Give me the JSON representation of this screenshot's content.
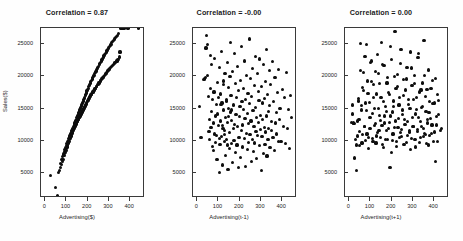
{
  "figure": {
    "width": 463,
    "height": 241,
    "background": "#fefefe",
    "point_color": "#0d0d0d",
    "axis_color": "#3a3a3a",
    "text_color": "#1f1f1f"
  },
  "chart_data": [
    {
      "type": "scatter",
      "title": "Correlation = 0.87",
      "xlabel": "Advertising($)",
      "ylabel": "Sales($)",
      "xlim": [
        -20,
        470
      ],
      "ylim": [
        1200,
        27500
      ],
      "xticks": [
        0,
        100,
        200,
        300,
        400
      ],
      "yticks": [
        5000,
        10000,
        15000,
        20000,
        25000
      ],
      "grid": false,
      "legend": null,
      "n_points": 200,
      "correlation": 0.87,
      "x": [
        24,
        49,
        58,
        62,
        66,
        70,
        73,
        76,
        78,
        80,
        82,
        84,
        86,
        88,
        90,
        91,
        93,
        95,
        96,
        98,
        99,
        101,
        102,
        104,
        105,
        106,
        108,
        109,
        110,
        112,
        113,
        114,
        116,
        117,
        118,
        119,
        121,
        122,
        123,
        125,
        126,
        127,
        128,
        130,
        131,
        132,
        133,
        134,
        136,
        137,
        138,
        139,
        140,
        141,
        143,
        144,
        145,
        146,
        147,
        148,
        150,
        151,
        152,
        153,
        154,
        155,
        157,
        158,
        159,
        160,
        161,
        162,
        163,
        165,
        166,
        167,
        168,
        169,
        170,
        171,
        172,
        174,
        175,
        176,
        177,
        178,
        179,
        180,
        181,
        183,
        184,
        185,
        186,
        187,
        188,
        189,
        190,
        192,
        193,
        194,
        195,
        196,
        197,
        198,
        200,
        201,
        202,
        203,
        205,
        206,
        207,
        208,
        210,
        211,
        212,
        214,
        215,
        216,
        218,
        219,
        221,
        222,
        224,
        225,
        227,
        228,
        230,
        231,
        233,
        234,
        236,
        237,
        239,
        240,
        242,
        243,
        245,
        246,
        248,
        250,
        251,
        253,
        254,
        256,
        257,
        259,
        261,
        262,
        264,
        265,
        267,
        269,
        270,
        272,
        274,
        275,
        277,
        279,
        280,
        282,
        284,
        286,
        287,
        289,
        291,
        293,
        295,
        296,
        298,
        300,
        302,
        304,
        306,
        308,
        310,
        312,
        314,
        316,
        318,
        320,
        322,
        325,
        327,
        329,
        331,
        334,
        336,
        338,
        341,
        343,
        346,
        349,
        352,
        355,
        359,
        363,
        368,
        375,
        390,
        440
      ],
      "y": [
        4700,
        2800,
        1500,
        5100,
        5500,
        6600,
        5900,
        6400,
        7100,
        6900,
        7600,
        7200,
        8000,
        7800,
        8400,
        8100,
        8700,
        8300,
        9000,
        8600,
        9300,
        8900,
        9600,
        9100,
        9900,
        9400,
        10100,
        9700,
        10400,
        9900,
        10600,
        10200,
        10800,
        10400,
        11000,
        10600,
        11200,
        10800,
        11400,
        11000,
        11600,
        11200,
        11800,
        11400,
        12000,
        11600,
        12200,
        11800,
        12400,
        12000,
        12600,
        12100,
        12800,
        12300,
        13000,
        12500,
        13200,
        12600,
        13400,
        12800,
        13600,
        13000,
        13800,
        13100,
        14000,
        13300,
        14200,
        13400,
        14400,
        13600,
        14600,
        13700,
        14800,
        13900,
        15000,
        14000,
        15200,
        14200,
        15400,
        14300,
        15600,
        14500,
        15800,
        14600,
        16000,
        14800,
        16200,
        14900,
        16400,
        15100,
        16600,
        15200,
        16800,
        15400,
        17000,
        15500,
        17200,
        15700,
        17400,
        15800,
        17600,
        16000,
        17800,
        16100,
        18000,
        16300,
        18200,
        16400,
        18400,
        16600,
        18600,
        16700,
        18800,
        16900,
        19000,
        17000,
        19200,
        17200,
        19400,
        17300,
        19600,
        17500,
        19800,
        17600,
        20000,
        17800,
        20200,
        17900,
        20400,
        18100,
        20600,
        18200,
        20800,
        18400,
        21000,
        18500,
        21200,
        18700,
        21400,
        18800,
        21600,
        19000,
        21800,
        19100,
        22000,
        19300,
        22200,
        19400,
        22400,
        19600,
        22600,
        19700,
        22800,
        19900,
        23000,
        20000,
        23200,
        20200,
        23400,
        20300,
        23600,
        20500,
        23800,
        20600,
        24000,
        20800,
        24200,
        20900,
        24400,
        21100,
        24600,
        21200,
        24800,
        21400,
        25000,
        21500,
        25200,
        21700,
        25400,
        21800,
        25600,
        22000,
        25800,
        22100,
        26000,
        22300,
        26200,
        22400,
        26400,
        22600,
        26600,
        23000,
        23800
      ]
    },
    {
      "type": "scatter",
      "title": "Correlation = -0.00",
      "xlabel": "Advertising(t-1)",
      "ylabel": "",
      "xlim": [
        -20,
        470
      ],
      "ylim": [
        1200,
        27500
      ],
      "xticks": [
        0,
        100,
        200,
        300,
        400
      ],
      "yticks": [
        5000,
        10000,
        15000,
        20000,
        25000
      ],
      "grid": false,
      "legend": null,
      "n_points": 200,
      "correlation": -0.0,
      "x": [
        12,
        18,
        28,
        33,
        37,
        41,
        44,
        47,
        50,
        52,
        55,
        57,
        59,
        61,
        63,
        65,
        67,
        69,
        71,
        73,
        75,
        77,
        79,
        81,
        83,
        85,
        87,
        89,
        91,
        93,
        95,
        97,
        99,
        101,
        103,
        105,
        107,
        109,
        111,
        113,
        115,
        117,
        119,
        121,
        123,
        125,
        127,
        129,
        131,
        133,
        135,
        137,
        139,
        141,
        143,
        145,
        147,
        149,
        151,
        153,
        155,
        157,
        159,
        161,
        163,
        165,
        167,
        169,
        171,
        173,
        175,
        177,
        179,
        181,
        183,
        185,
        187,
        189,
        191,
        193,
        195,
        197,
        199,
        201,
        203,
        205,
        207,
        209,
        211,
        213,
        215,
        217,
        219,
        221,
        223,
        225,
        227,
        229,
        231,
        233,
        235,
        237,
        239,
        241,
        243,
        245,
        247,
        249,
        251,
        253,
        255,
        257,
        259,
        261,
        263,
        265,
        267,
        269,
        271,
        273,
        275,
        277,
        279,
        281,
        283,
        285,
        287,
        289,
        291,
        293,
        295,
        297,
        299,
        301,
        303,
        305,
        307,
        309,
        311,
        313,
        315,
        317,
        319,
        321,
        323,
        325,
        327,
        329,
        331,
        333,
        335,
        337,
        339,
        341,
        343,
        345,
        348,
        351,
        354,
        357,
        360,
        363,
        366,
        369,
        372,
        375,
        378,
        381,
        384,
        387,
        390,
        395,
        400,
        405,
        410,
        415,
        420,
        425,
        430,
        435,
        440,
        445,
        106,
        112,
        118,
        124,
        130,
        136,
        142,
        148,
        154,
        160
      ],
      "y": [
        15300,
        10500,
        19500,
        19600,
        19800,
        24400,
        26300,
        20200,
        24900,
        16900,
        11500,
        13400,
        10300,
        23300,
        18200,
        12100,
        14600,
        21900,
        9200,
        16400,
        8500,
        12800,
        17600,
        11100,
        22800,
        9800,
        13900,
        15700,
        10900,
        7200,
        19100,
        14200,
        16800,
        12400,
        5100,
        21400,
        9500,
        13100,
        17300,
        10700,
        23900,
        15900,
        6300,
        12000,
        14800,
        18700,
        9900,
        11600,
        20500,
        13600,
        7800,
        16200,
        10200,
        22100,
        12900,
        5600,
        15100,
        18300,
        8900,
        11300,
        14500,
        25200,
        17100,
        9600,
        13200,
        6700,
        20800,
        11900,
        15600,
        10100,
        23600,
        12600,
        18900,
        8200,
        14100,
        16700,
        9400,
        21600,
        12200,
        5900,
        17800,
        10600,
        13800,
        15400,
        7500,
        19400,
        11700,
        24700,
        16100,
        9100,
        12500,
        14900,
        18100,
        10400,
        22400,
        13500,
        6100,
        16500,
        11200,
        20100,
        14300,
        8700,
        17400,
        9800,
        12700,
        15800,
        25800,
        11000,
        19700,
        13100,
        6900,
        16900,
        10300,
        21200,
        14700,
        8400,
        12300,
        18600,
        9700,
        23100,
        15200,
        11500,
        13700,
        7300,
        20400,
        10900,
        17700,
        12900,
        16300,
        9300,
        22700,
        14000,
        11800,
        5400,
        18400,
        10700,
        13400,
        15900,
        8100,
        21800,
        12100,
        16600,
        9500,
        19200,
        11400,
        24200,
        13900,
        7700,
        17200,
        10200,
        14600,
        12000,
        20900,
        15500,
        9000,
        18800,
        11600,
        13000,
        22300,
        10500,
        16100,
        8600,
        19900,
        12800,
        14400,
        11100,
        17500,
        9900,
        21100,
        13300,
        15000,
        10000,
        18000,
        12200,
        16800,
        9600,
        20600,
        11900,
        14900,
        8800,
        17000,
        13600,
        10400,
        15700,
        12400,
        19300,
        11000,
        16400,
        9400,
        13800,
        20000,
        14800
      ]
    },
    {
      "type": "scatter",
      "title": "Correlation = 0.00",
      "xlabel": "Advertising(t+1)",
      "ylabel": "",
      "xlim": [
        -20,
        470
      ],
      "ylim": [
        1200,
        27500
      ],
      "xticks": [
        0,
        100,
        200,
        300,
        400
      ],
      "yticks": [
        5000,
        10000,
        15000,
        20000,
        25000
      ],
      "grid": false,
      "legend": null,
      "n_points": 200,
      "correlation": 0.0,
      "x": [
        10,
        16,
        22,
        30,
        36,
        40,
        44,
        48,
        52,
        56,
        60,
        64,
        68,
        72,
        76,
        80,
        84,
        88,
        92,
        96,
        100,
        104,
        108,
        112,
        116,
        120,
        124,
        128,
        132,
        136,
        140,
        144,
        148,
        152,
        156,
        160,
        164,
        168,
        172,
        176,
        180,
        184,
        188,
        192,
        196,
        200,
        204,
        208,
        212,
        216,
        220,
        224,
        228,
        232,
        236,
        240,
        244,
        248,
        252,
        256,
        260,
        264,
        268,
        272,
        276,
        280,
        284,
        288,
        292,
        296,
        300,
        304,
        308,
        312,
        316,
        320,
        324,
        328,
        332,
        336,
        340,
        344,
        348,
        352,
        356,
        360,
        364,
        368,
        372,
        376,
        380,
        385,
        390,
        395,
        400,
        405,
        410,
        415,
        420,
        430,
        14,
        20,
        26,
        34,
        38,
        42,
        46,
        50,
        54,
        58,
        62,
        66,
        70,
        74,
        78,
        82,
        86,
        90,
        94,
        98,
        102,
        106,
        110,
        114,
        118,
        122,
        126,
        130,
        134,
        138,
        142,
        146,
        150,
        154,
        158,
        162,
        166,
        170,
        174,
        178,
        182,
        186,
        190,
        194,
        198,
        202,
        206,
        210,
        214,
        218,
        222,
        226,
        230,
        234,
        238,
        242,
        246,
        250,
        254,
        258,
        262,
        266,
        270,
        274,
        278,
        282,
        286,
        290,
        294,
        298,
        302,
        306,
        310,
        314,
        318,
        322,
        326,
        330,
        334,
        338,
        342,
        346,
        350,
        354,
        358,
        362,
        366,
        370,
        374,
        378,
        382,
        387,
        392,
        397,
        402,
        407,
        412,
        417,
        422,
        435
      ],
      "y": [
        12900,
        15600,
        12700,
        10200,
        9400,
        13100,
        16200,
        11500,
        25100,
        14800,
        9700,
        18300,
        20600,
        12200,
        15900,
        24900,
        11100,
        17400,
        10500,
        13600,
        22100,
        19200,
        14300,
        9900,
        16700,
        12400,
        20800,
        10800,
        23400,
        15100,
        11700,
        18900,
        13200,
        25300,
        9500,
        16100,
        21700,
        12800,
        10300,
        14600,
        19800,
        11900,
        17200,
        5900,
        13900,
        22600,
        10100,
        15400,
        12100,
        26900,
        18100,
        9200,
        20300,
        13500,
        16800,
        11300,
        24200,
        10700,
        14100,
        19500,
        12600,
        17900,
        9800,
        21400,
        13000,
        15700,
        11600,
        23800,
        10400,
        18600,
        12300,
        16400,
        20100,
        9100,
        14900,
        11800,
        22900,
        13700,
        17600,
        10600,
        15200,
        19000,
        12000,
        25600,
        11200,
        16900,
        9600,
        13400,
        21000,
        14400,
        10900,
        18200,
        12500,
        15800,
        11400,
        19700,
        13800,
        10000,
        16300,
        11700,
        14200,
        12800,
        7400,
        5400,
        10800,
        16600,
        13300,
        9300,
        20900,
        15500,
        11000,
        17800,
        12200,
        23100,
        10100,
        14700,
        19300,
        8900,
        16000,
        11900,
        13600,
        22400,
        10400,
        18700,
        15100,
        12700,
        9700,
        17300,
        11300,
        20500,
        14000,
        10600,
        16800,
        12400,
        21800,
        9000,
        13900,
        15300,
        11600,
        19000,
        10200,
        17500,
        12900,
        24600,
        8300,
        14500,
        11100,
        16200,
        20000,
        13100,
        9900,
        18400,
        12100,
        15600,
        10500,
        22000,
        11800,
        14800,
        17000,
        9500,
        13400,
        12600,
        19600,
        10900,
        16500,
        11400,
        15000,
        8700,
        21300,
        13700,
        12200,
        18900,
        10300,
        14200,
        16700,
        11500,
        23500,
        9800,
        13000,
        17900,
        12300,
        15400,
        10700,
        20200,
        11000,
        14600,
        18000,
        12800,
        9400,
        16100,
        13500,
        11200,
        19400,
        10000,
        15900,
        6800,
        12500,
        17200,
        14100,
        11900,
        13800,
        2300
      ]
    }
  ]
}
